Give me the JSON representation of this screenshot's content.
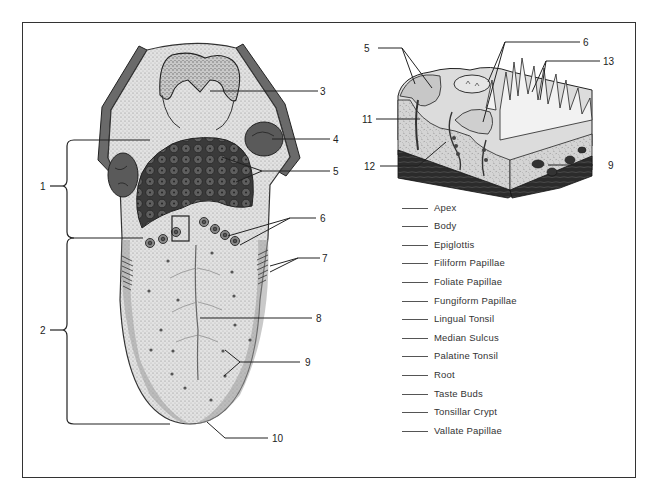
{
  "diagram": {
    "callouts": {
      "left": [
        {
          "id": "1",
          "label": "1"
        },
        {
          "id": "2",
          "label": "2"
        }
      ],
      "tongue": [
        {
          "id": "3",
          "label": "3"
        },
        {
          "id": "4",
          "label": "4"
        },
        {
          "id": "5",
          "label": "5"
        },
        {
          "id": "6",
          "label": "6"
        },
        {
          "id": "7",
          "label": "7"
        },
        {
          "id": "8",
          "label": "8"
        },
        {
          "id": "9",
          "label": "9"
        },
        {
          "id": "10",
          "label": "10"
        }
      ],
      "block": [
        {
          "id": "5b",
          "label": "5"
        },
        {
          "id": "6b",
          "label": "6"
        },
        {
          "id": "13",
          "label": "13"
        },
        {
          "id": "11",
          "label": "11"
        },
        {
          "id": "12",
          "label": "12"
        },
        {
          "id": "9b",
          "label": "9"
        }
      ]
    },
    "terms": [
      "Apex",
      "Body",
      "Epiglottis",
      "Filiform Papillae",
      "Foliate Papillae",
      "Fungiform Papillae",
      "Lingual Tonsil",
      "Median Sulcus",
      "Palatine Tonsil",
      "Root",
      "Taste Buds",
      "Tonsillar Crypt",
      "Vallate Papillae"
    ],
    "colors": {
      "ink": "#222222",
      "tongue_fill": "#d9d9d9",
      "tonsil_fill": "#555555",
      "dark_tissue": "#2a2a2a",
      "border": "#333333"
    }
  }
}
